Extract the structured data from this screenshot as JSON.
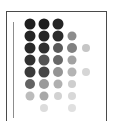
{
  "figure": {
    "title": "",
    "panel_border_color": "#4a4a4a",
    "axis_spine_color": "#8d8d8d",
    "background_color": "#ffffff"
  },
  "chart_data": {
    "type": "heatmap",
    "title": "",
    "subtitle": "",
    "xlabel": "",
    "ylabel": "",
    "grid": false,
    "legend": "none",
    "categories": [
      "c1",
      "c2",
      "c3",
      "c4",
      "c5"
    ],
    "rows": [
      "r1",
      "r2",
      "r3",
      "r4",
      "r5",
      "r6",
      "r7",
      "r8"
    ],
    "xlim": [
      0,
      5
    ],
    "ylim": [
      0,
      8
    ],
    "x_tick_labels": [],
    "y_tick_labels": [],
    "value_scale": {
      "min": 0,
      "max": 1,
      "colormap": "greys",
      "dark_hex": "#1a1a1a",
      "light_hex": "#e4e4e4"
    },
    "cells": [
      {
        "row": 0,
        "col": 0,
        "value": 1.0,
        "color": "#1e1e1e",
        "size": 11
      },
      {
        "row": 0,
        "col": 1,
        "value": 1.0,
        "color": "#1e1e1e",
        "size": 11
      },
      {
        "row": 0,
        "col": 2,
        "value": 0.98,
        "color": "#242424",
        "size": 11
      },
      {
        "row": 1,
        "col": 0,
        "value": 0.97,
        "color": "#242424",
        "size": 11
      },
      {
        "row": 1,
        "col": 1,
        "value": 0.96,
        "color": "#262626",
        "size": 11
      },
      {
        "row": 1,
        "col": 2,
        "value": 0.94,
        "color": "#2b2b2b",
        "size": 11
      },
      {
        "row": 1,
        "col": 3,
        "value": 0.58,
        "color": "#8c8c8c",
        "size": 9
      },
      {
        "row": 2,
        "col": 0,
        "value": 0.95,
        "color": "#282828",
        "size": 11
      },
      {
        "row": 2,
        "col": 1,
        "value": 0.93,
        "color": "#2e2e2e",
        "size": 11
      },
      {
        "row": 2,
        "col": 2,
        "value": 0.78,
        "color": "#595959",
        "size": 10
      },
      {
        "row": 2,
        "col": 3,
        "value": 0.62,
        "color": "#808080",
        "size": 10
      },
      {
        "row": 2,
        "col": 4,
        "value": 0.3,
        "color": "#c6c6c6",
        "size": 8
      },
      {
        "row": 3,
        "col": 0,
        "value": 0.92,
        "color": "#303030",
        "size": 11
      },
      {
        "row": 3,
        "col": 1,
        "value": 0.8,
        "color": "#545454",
        "size": 11
      },
      {
        "row": 3,
        "col": 2,
        "value": 0.72,
        "color": "#686868",
        "size": 10
      },
      {
        "row": 3,
        "col": 3,
        "value": 0.48,
        "color": "#a2a2a2",
        "size": 9
      },
      {
        "row": 4,
        "col": 0,
        "value": 0.88,
        "color": "#3a3a3a",
        "size": 11
      },
      {
        "row": 4,
        "col": 1,
        "value": 0.84,
        "color": "#474747",
        "size": 11
      },
      {
        "row": 4,
        "col": 2,
        "value": 0.55,
        "color": "#949494",
        "size": 10
      },
      {
        "row": 4,
        "col": 3,
        "value": 0.4,
        "color": "#b4b4b4",
        "size": 9
      },
      {
        "row": 4,
        "col": 4,
        "value": 0.22,
        "color": "#d6d6d6",
        "size": 8
      },
      {
        "row": 5,
        "col": 0,
        "value": 0.74,
        "color": "#636363",
        "size": 10
      },
      {
        "row": 5,
        "col": 1,
        "value": 0.52,
        "color": "#9a9a9a",
        "size": 10
      },
      {
        "row": 5,
        "col": 2,
        "value": 0.42,
        "color": "#b0b0b0",
        "size": 9
      },
      {
        "row": 5,
        "col": 3,
        "value": 0.26,
        "color": "#cecece",
        "size": 8
      },
      {
        "row": 6,
        "col": 0,
        "value": 0.36,
        "color": "#bcbcbc",
        "size": 9
      },
      {
        "row": 6,
        "col": 1,
        "value": 0.46,
        "color": "#a8a8a8",
        "size": 9
      },
      {
        "row": 6,
        "col": 2,
        "value": 0.24,
        "color": "#d2d2d2",
        "size": 8
      },
      {
        "row": 6,
        "col": 3,
        "value": 0.2,
        "color": "#d8d8d8",
        "size": 8
      },
      {
        "row": 7,
        "col": 1,
        "value": 0.18,
        "color": "#dcdcdc",
        "size": 8
      },
      {
        "row": 7,
        "col": 3,
        "value": 0.16,
        "color": "#e0e0e0",
        "size": 8
      }
    ],
    "layout": {
      "origin_x": 30,
      "origin_y": 24,
      "col_step": 14,
      "row_step": 12
    }
  }
}
